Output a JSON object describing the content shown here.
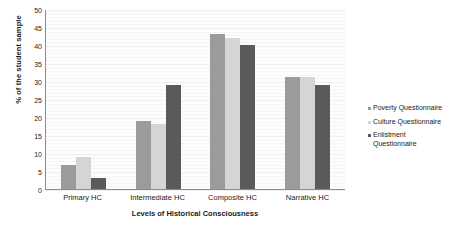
{
  "chart_data": {
    "type": "bar",
    "title": "",
    "xlabel": "Levels of Historical Consciousness",
    "ylabel": "% of the student sample",
    "categories": [
      "Primary HC",
      "Intermediate HC",
      "Composite HC",
      "Narrative HC"
    ],
    "series": [
      {
        "name": "Poverty Questionnaire",
        "color": "#9b9b9b",
        "values": [
          6.8,
          19,
          43,
          31
        ]
      },
      {
        "name": "Culture Questionnaire",
        "color": "#d5d5d5",
        "values": [
          9,
          18,
          42,
          31
        ]
      },
      {
        "name": "Enlistment Questionnaire",
        "color": "#5a5a5a",
        "values": [
          3,
          29,
          40,
          29
        ]
      }
    ],
    "ylim": [
      0,
      50
    ],
    "yticks": [
      0,
      5,
      10,
      15,
      20,
      25,
      30,
      35,
      40,
      45,
      50
    ],
    "ytick_labels": [
      "0",
      "5",
      "10",
      "15",
      "20",
      "25",
      "30",
      "35",
      "40",
      "45",
      "50"
    ],
    "grid": true,
    "legend_position": "right"
  }
}
